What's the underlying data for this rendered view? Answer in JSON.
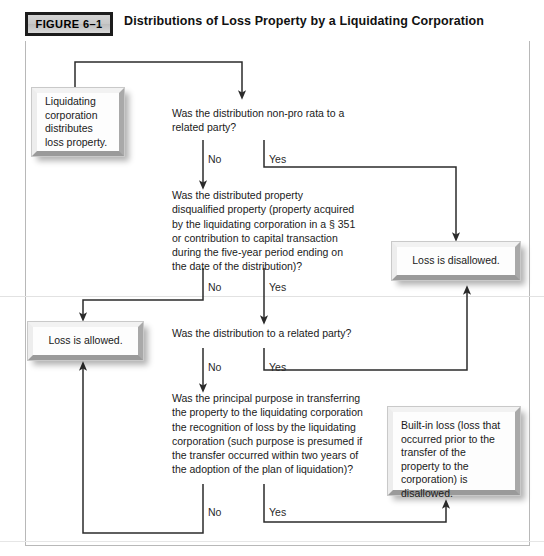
{
  "header": {
    "figure_tag": "FIGURE 6–1",
    "title": "Distributions of Loss Property by a Liquidating Corporation"
  },
  "nodes": {
    "start": {
      "name": "start-terminator",
      "text": "Liquidating corporation distributes loss property."
    },
    "q1": {
      "name": "question-non-pro-rata",
      "text": "Was the distribution non-pro rata to a related party?"
    },
    "q2": {
      "name": "question-disqualified-property",
      "text": "Was the distributed property disqualified property (property acquired by the liquidating corporation in a § 351 or contribution to capital transaction during the five-year period ending on the date of the distribution)?"
    },
    "q3": {
      "name": "question-related-party",
      "text": "Was the distribution to a related party?"
    },
    "q4": {
      "name": "question-principal-purpose",
      "text": "Was the principal purpose in transferring the property to the liquidating corporation the recognition of loss by the liquidating corporation (such purpose is presumed if the transfer occurred within two years of the adoption of the plan of liquidation)?"
    },
    "disallowed": {
      "name": "outcome-loss-disallowed",
      "text": "Loss is disallowed."
    },
    "allowed": {
      "name": "outcome-loss-allowed",
      "text": "Loss is allowed."
    },
    "builtin": {
      "name": "outcome-built-in-loss-disallowed",
      "text": "Built-in loss (loss that occurred prior to the transfer of the property to the corporation) is disallowed."
    }
  },
  "branch_labels": {
    "q1_no": "No",
    "q1_yes": "Yes",
    "q2_no": "No",
    "q2_yes": "Yes",
    "q3_no": "No",
    "q3_yes": "Yes",
    "q4_no": "No",
    "q4_yes": "Yes"
  },
  "colors": {
    "line": "#2b2b2b",
    "frame": "#b8b8b8",
    "tag_fill": "#cccccc",
    "tag_border": "#1c1c1c",
    "box_face": "#fdfdfd",
    "box_shadow": "#9a9a9a"
  }
}
